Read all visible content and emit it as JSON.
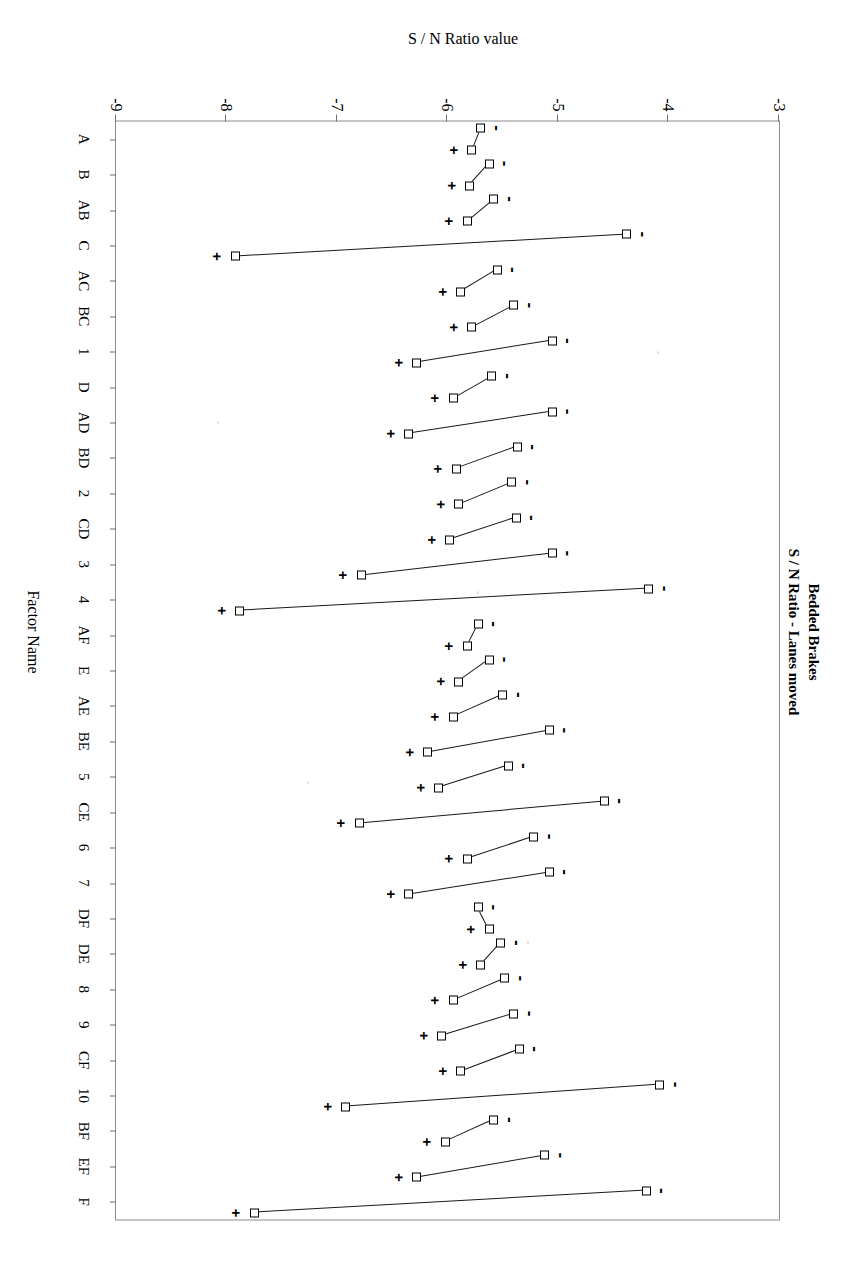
{
  "titles": {
    "line1": "Bedded Brakes",
    "line2": "S / N Ratio - Lanes moved",
    "value_axis": "S / N Ratio value",
    "category_axis": "Factor Name"
  },
  "axes": {
    "value_ticks": [
      "-3",
      "-4",
      "-5",
      "-6",
      "-7",
      "-8",
      "-9"
    ],
    "value_min": -9,
    "value_max": -3
  },
  "marks": {
    "plus": "+",
    "minus": "-"
  },
  "chart_data": {
    "type": "line",
    "xlabel": "Factor Name",
    "ylabel": "S / N Ratio value",
    "ylim": [
      -9,
      -3
    ],
    "grid": false,
    "legend": "none",
    "note": "Main-effects plot: for each factor the low (-) and high (+) level S/N responses are plotted and joined by a line. Marker '+' labels the high-level point, '-' labels the low-level point.",
    "categories": [
      "A",
      "B",
      "AB",
      "C",
      "AC",
      "BC",
      "1",
      "D",
      "AD",
      "BD",
      "2",
      "CD",
      "3",
      "4",
      "AF",
      "E",
      "AE",
      "BE",
      "5",
      "CE",
      "6",
      "7",
      "DF",
      "DE",
      "8",
      "9",
      "CF",
      "10",
      "BF",
      "EF",
      "F"
    ],
    "series": [
      {
        "name": "minus-level",
        "values": [
          -5.7,
          -5.62,
          -5.58,
          -4.38,
          -5.55,
          -5.4,
          -5.05,
          -5.6,
          -5.05,
          -5.37,
          -5.42,
          -5.38,
          -5.05,
          -4.18,
          -5.72,
          -5.62,
          -5.5,
          -5.08,
          -5.45,
          -4.58,
          -5.22,
          -5.08,
          -5.72,
          -5.52,
          -5.48,
          -5.4,
          -5.35,
          -4.08,
          -5.58,
          -5.12,
          -4.2
        ]
      },
      {
        "name": "plus-level",
        "values": [
          -5.78,
          -5.8,
          -5.82,
          -7.92,
          -5.88,
          -5.78,
          -6.28,
          -5.95,
          -6.35,
          -5.92,
          -5.9,
          -5.98,
          -6.78,
          -7.88,
          -5.82,
          -5.9,
          -5.95,
          -6.18,
          -6.08,
          -6.8,
          -5.82,
          -6.35,
          -5.62,
          -5.7,
          -5.95,
          -6.05,
          -5.88,
          -6.92,
          -6.02,
          -6.28,
          -7.75
        ]
      }
    ]
  }
}
